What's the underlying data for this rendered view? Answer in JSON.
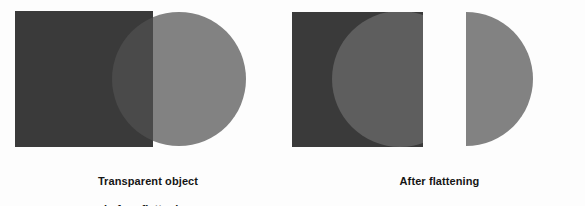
{
  "figure": {
    "width": 585,
    "height": 206,
    "background_color": "#fdfdfd"
  },
  "panels": [
    {
      "id": "before",
      "caption_line1": "Transparent object",
      "caption_line2": "before flattening",
      "caption": "Transparent object before flattening"
    },
    {
      "id": "after",
      "caption_line1": "After flattening",
      "caption_line2": "",
      "caption": "After flattening"
    }
  ],
  "colors": {
    "dark_rect": "#3a3a3a",
    "overlap": "#4a4a4a",
    "light_circle": "#828282",
    "mid_lens": "#5e5e5e",
    "background": "#fdfdfd"
  },
  "shapes": {
    "before": {
      "rectangle": {
        "x": 15,
        "y": 11,
        "width": 138,
        "height": 136,
        "color": "#3a3a3a"
      },
      "circle": {
        "cx": 179,
        "cy": 79,
        "r": 67,
        "color": "#828282",
        "opacity": "transparent"
      },
      "overlap_color": "#4a4a4a"
    },
    "after": {
      "notched_rectangle": {
        "x": 285,
        "y": 12,
        "width": 138,
        "height": 135,
        "color": "#3a3a3a"
      },
      "lens": {
        "x": 412,
        "y": 25,
        "width": 44,
        "height": 110,
        "color": "#5e5e5e"
      },
      "half_circle": {
        "cx": 466,
        "cy": 79,
        "r": 67,
        "color": "#828282"
      }
    }
  }
}
